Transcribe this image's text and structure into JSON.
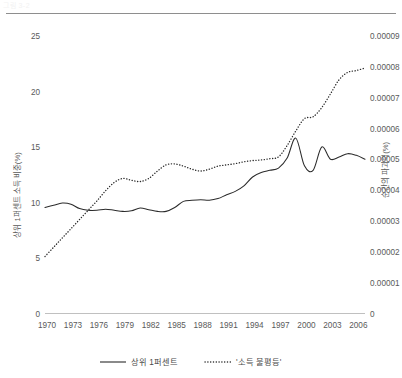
{
  "header": {
    "clipped_text": "그림 3-2"
  },
  "chart_data": {
    "type": "line",
    "title": "",
    "xlabel": "",
    "ylabel": "상위 1퍼센트 소득 비중(%)",
    "y2label": "순간의 파괴력(%)",
    "grid": false,
    "legend_position": "bottom",
    "x": [
      1970,
      1971,
      1972,
      1973,
      1974,
      1975,
      1976,
      1977,
      1978,
      1979,
      1980,
      1981,
      1982,
      1983,
      1984,
      1985,
      1986,
      1987,
      1988,
      1989,
      1990,
      1991,
      1992,
      1993,
      1994,
      1995,
      1996,
      1997,
      1998,
      1999,
      2000,
      2001,
      2002,
      2003,
      2004,
      2005,
      2006,
      2007
    ],
    "xticks": [
      "1970",
      "1973",
      "1976",
      "1979",
      "1982",
      "1985",
      "1988",
      "1991",
      "1994",
      "1997",
      "2000",
      "2003",
      "2006"
    ],
    "xlim": [
      1970,
      2007
    ],
    "ylim": [
      0,
      25
    ],
    "yticks": [
      "0",
      "5",
      "10",
      "15",
      "20",
      "25"
    ],
    "y2lim": [
      0,
      9e-05
    ],
    "y2ticks": [
      "0",
      "0.00001",
      "0.00002",
      "0.00003",
      "0.00004",
      "0.00005",
      "0.00006",
      "0.00007",
      "0.00008",
      "0.00009"
    ],
    "series": [
      {
        "name": "상위 1퍼센트",
        "style": "solid",
        "axis": "left",
        "values": [
          9.55,
          9.75,
          9.95,
          9.85,
          9.45,
          9.3,
          9.3,
          9.4,
          9.3,
          9.2,
          9.25,
          9.5,
          9.35,
          9.2,
          9.2,
          9.55,
          10.1,
          10.2,
          10.25,
          10.2,
          10.35,
          10.7,
          11.0,
          11.5,
          12.3,
          12.7,
          12.9,
          13.1,
          14.0,
          15.8,
          13.3,
          12.9,
          15.0,
          13.9,
          14.1,
          14.4,
          14.25,
          13.9
        ]
      },
      {
        "name": "'소득 불평등'",
        "style": "dotted",
        "axis": "right",
        "values": [
          1.85e-05,
          2.15e-05,
          2.45e-05,
          2.75e-05,
          3.05e-05,
          3.35e-05,
          3.65e-05,
          3.98e-05,
          4.25e-05,
          4.38e-05,
          4.32e-05,
          4.28e-05,
          4.38e-05,
          4.62e-05,
          4.82e-05,
          4.85e-05,
          4.78e-05,
          4.68e-05,
          4.62e-05,
          4.68e-05,
          4.78e-05,
          4.82e-05,
          4.86e-05,
          4.92e-05,
          4.96e-05,
          4.98e-05,
          5.02e-05,
          5.08e-05,
          5.45e-05,
          5.92e-05,
          6.32e-05,
          6.38e-05,
          6.68e-05,
          7.12e-05,
          7.58e-05,
          7.82e-05,
          7.88e-05,
          7.96e-05
        ]
      }
    ],
    "annotations": []
  },
  "legend": {
    "items": [
      {
        "label": "상위 1퍼센트",
        "style": "solid"
      },
      {
        "label": "'소득 불평등'",
        "style": "dotted"
      }
    ]
  },
  "axes": {
    "left": {
      "label": "상위 1퍼센트 소득 비중(%)",
      "ticks": [
        "0",
        "5",
        "10",
        "15",
        "20",
        "25"
      ]
    },
    "right": {
      "label": "순간의 파괴력(%)",
      "ticks": [
        "0",
        "0.00001",
        "0.00002",
        "0.00003",
        "0.00004",
        "0.00005",
        "0.00006",
        "0.00007",
        "0.00008",
        "0.00009"
      ]
    },
    "bottom": {
      "ticks": [
        "1970",
        "1973",
        "1976",
        "1979",
        "1982",
        "1985",
        "1988",
        "1991",
        "1994",
        "1997",
        "2000",
        "2003",
        "2006"
      ]
    }
  }
}
